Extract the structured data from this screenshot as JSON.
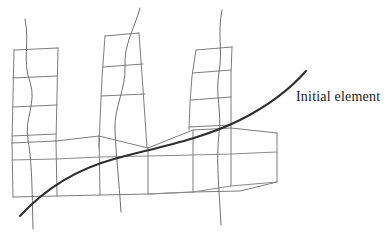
{
  "figure": {
    "title": "",
    "kind": "hand-drawn-mesh-diagram",
    "canvas": {
      "width": 385,
      "height": 232,
      "background": "#ffffff"
    },
    "colors": {
      "mesh_stroke": "#7d7d7d",
      "mesh_stroke_soft": "#8a8a8a",
      "wavy_stroke": "#6f6f6f",
      "initial_curve_stroke": "#2f2f2f",
      "label_color": "#1c1c1c"
    },
    "labels": {
      "initial_element": "Initial element"
    },
    "annotations": {
      "initial_curve": {
        "name": "Initial element",
        "stroke_width": 2.1,
        "start": [
          20,
          216
        ],
        "end": [
          306,
          71
        ]
      }
    },
    "components": {
      "towers": [
        {
          "name": "left-tower",
          "columns": 1,
          "rows": 4
        },
        {
          "name": "middle-tower",
          "columns": 1,
          "rows": 3
        },
        {
          "name": "right-tower",
          "columns": 1,
          "rows": 3
        }
      ],
      "base_slab": {
        "name": "base-slab",
        "cells": 5
      },
      "wavy_vertical_lines": 3
    }
  }
}
